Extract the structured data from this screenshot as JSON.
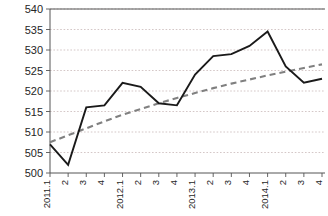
{
  "chart_data": {
    "type": "line",
    "title": "",
    "subtitle": "",
    "xlabel": "",
    "ylabel": "",
    "ylim": [
      500,
      540
    ],
    "yticks": [
      500,
      505,
      510,
      515,
      520,
      525,
      530,
      535,
      540
    ],
    "grid": true,
    "legend": "none",
    "categories": [
      "2011.1",
      "2",
      "3",
      "4",
      "2012.1",
      "2",
      "3",
      "4",
      "2013.1",
      "2",
      "3",
      "4",
      "2014.1",
      "2",
      "3",
      "4"
    ],
    "series": [
      {
        "name": "value",
        "style": "solid",
        "color": "#1a1a1a",
        "values": [
          507.0,
          502.0,
          516.0,
          516.5,
          522.0,
          521.0,
          517.0,
          516.5,
          524.0,
          528.5,
          529.0,
          531.0,
          534.5,
          526.0,
          522.0,
          523.0
        ]
      },
      {
        "name": "trend",
        "style": "dashed",
        "color": "#808080",
        "values": [
          507.5,
          509.2,
          510.9,
          512.6,
          514.2,
          515.6,
          517.0,
          518.3,
          519.5,
          520.7,
          521.8,
          522.8,
          523.8,
          524.7,
          525.6,
          526.5
        ]
      }
    ]
  },
  "axes": {
    "y_tick_labels": [
      "540",
      "535",
      "530",
      "525",
      "520",
      "515",
      "510",
      "505",
      "500"
    ],
    "x_tick_labels": [
      "2011.1",
      "2",
      "3",
      "4",
      "2012.1",
      "2",
      "3",
      "4",
      "2013.1",
      "2",
      "3",
      "4",
      "2014.1",
      "2",
      "3",
      "4"
    ]
  }
}
